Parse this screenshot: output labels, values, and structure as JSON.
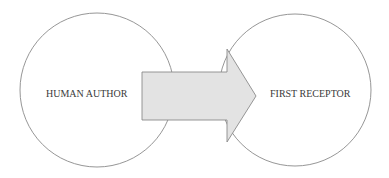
{
  "diagram": {
    "nodes": [
      {
        "id": "human-author",
        "label": "HUMAN AUTHOR",
        "shape": "circle"
      },
      {
        "id": "first-receptor",
        "label": "FIRST RECEPTOR",
        "shape": "circle"
      }
    ],
    "edges": [
      {
        "from": "human-author",
        "to": "first-receptor",
        "style": "block-arrow"
      }
    ],
    "colors": {
      "stroke": "#8a8a8a",
      "arrow_fill": "#e3e3e3",
      "arrow_stroke": "#8a8a8a",
      "text": "#3a3a3a",
      "background": "#ffffff"
    }
  }
}
